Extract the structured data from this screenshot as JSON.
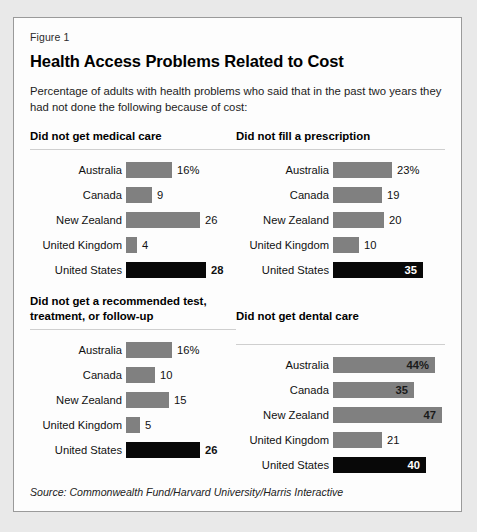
{
  "figure": {
    "label": "Figure 1",
    "title": "Health Access Problems Related to Cost",
    "subtitle": "Percentage of adults with health problems who said that in the past two years they had not done the following because of cost:",
    "source": "Source: Commonwealth Fund/Harvard University/Harris Interactive"
  },
  "colors": {
    "bar_gray": "#808080",
    "bar_black": "#080808",
    "card_background": "#fdfdfd",
    "page_background": "#e9e9e9",
    "border": "#9a9a9a"
  },
  "chart_data": [
    {
      "type": "bar",
      "title": "Did not get medical care",
      "xlabel": "",
      "ylabel": "",
      "orientation": "horizontal",
      "grid": false,
      "legend": "none",
      "xlim": [
        0,
        28
      ],
      "categories": [
        "Australia",
        "Canada",
        "New Zealand",
        "United Kingdom",
        "United States"
      ],
      "values": [
        16,
        9,
        26,
        4,
        28
      ],
      "value_labels": [
        "16%",
        "9",
        "26",
        "4",
        "28"
      ],
      "highlight_index": 4,
      "label_placement": [
        "outside",
        "outside",
        "outside",
        "outside",
        "outside"
      ]
    },
    {
      "type": "bar",
      "title": "Did not fill a prescription",
      "xlabel": "",
      "ylabel": "",
      "orientation": "horizontal",
      "grid": false,
      "legend": "none",
      "xlim": [
        0,
        35
      ],
      "categories": [
        "Australia",
        "Canada",
        "New Zealand",
        "United Kingdom",
        "United States"
      ],
      "values": [
        23,
        19,
        20,
        10,
        35
      ],
      "value_labels": [
        "23%",
        "19",
        "20",
        "10",
        "35"
      ],
      "highlight_index": 4,
      "label_placement": [
        "outside",
        "outside",
        "outside",
        "outside",
        "inside"
      ]
    },
    {
      "type": "bar",
      "title": "Did not get a recommended test, treatment, or follow-up",
      "xlabel": "",
      "ylabel": "",
      "orientation": "horizontal",
      "grid": false,
      "legend": "none",
      "xlim": [
        0,
        26
      ],
      "categories": [
        "Australia",
        "Canada",
        "New Zealand",
        "United Kingdom",
        "United States"
      ],
      "values": [
        16,
        10,
        15,
        5,
        26
      ],
      "value_labels": [
        "16%",
        "10",
        "15",
        "5",
        "26"
      ],
      "highlight_index": 4,
      "label_placement": [
        "outside",
        "outside",
        "outside",
        "outside",
        "outside"
      ]
    },
    {
      "type": "bar",
      "title": "Did not get dental care",
      "xlabel": "",
      "ylabel": "",
      "orientation": "horizontal",
      "grid": false,
      "legend": "none",
      "xlim": [
        0,
        47
      ],
      "categories": [
        "Australia",
        "Canada",
        "New Zealand",
        "United Kingdom",
        "United States"
      ],
      "values": [
        44,
        35,
        47,
        21,
        40
      ],
      "value_labels": [
        "44%",
        "35",
        "47",
        "21",
        "40"
      ],
      "highlight_index": 4,
      "label_placement": [
        "inside",
        "inside",
        "inside",
        "outside",
        "inside"
      ]
    }
  ],
  "scales_px_per_unit": [
    2.85,
    2.57,
    2.85,
    2.32
  ],
  "bar_height_px": 16
}
